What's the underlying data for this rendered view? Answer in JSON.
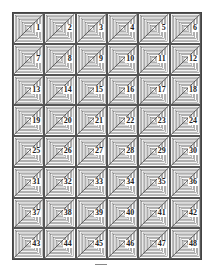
{
  "diagram": {
    "type": "tile-grid",
    "columns": 6,
    "rows": 8,
    "tile_pattern": "concentric-squares-with-diagonal",
    "line_color": "#555555",
    "tiles": [
      {
        "label": "1"
      },
      {
        "label": "2"
      },
      {
        "label": "3"
      },
      {
        "label": "4"
      },
      {
        "label": "5"
      },
      {
        "label": "6"
      },
      {
        "label": "7"
      },
      {
        "label": "8"
      },
      {
        "label": "9"
      },
      {
        "label": "10"
      },
      {
        "label": "11"
      },
      {
        "label": "12"
      },
      {
        "label": "13"
      },
      {
        "label": "14"
      },
      {
        "label": "15"
      },
      {
        "label": "16"
      },
      {
        "label": "17"
      },
      {
        "label": "18"
      },
      {
        "label": "19"
      },
      {
        "label": "20"
      },
      {
        "label": "21"
      },
      {
        "label": "22"
      },
      {
        "label": "23"
      },
      {
        "label": "24"
      },
      {
        "label": "25"
      },
      {
        "label": "26"
      },
      {
        "label": "27"
      },
      {
        "label": "28"
      },
      {
        "label": "29"
      },
      {
        "label": "30"
      },
      {
        "label": "31"
      },
      {
        "label": "32"
      },
      {
        "label": "33"
      },
      {
        "label": "34"
      },
      {
        "label": "35"
      },
      {
        "label": "36"
      },
      {
        "label": "37"
      },
      {
        "label": "38"
      },
      {
        "label": "39"
      },
      {
        "label": "40"
      },
      {
        "label": "41"
      },
      {
        "label": "42"
      },
      {
        "label": "43"
      },
      {
        "label": "44"
      },
      {
        "label": "45"
      },
      {
        "label": "46"
      },
      {
        "label": "47"
      },
      {
        "label": "48"
      }
    ]
  }
}
